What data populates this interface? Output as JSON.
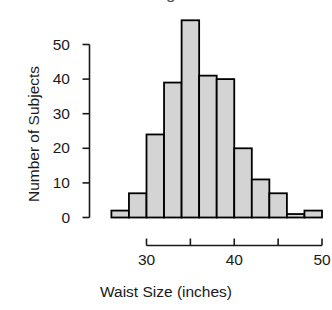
{
  "chart_data": {
    "type": "bar",
    "title": "Histogram",
    "title_truncated": true,
    "xlabel": "Waist Size (inches)",
    "ylabel": "Number of Subjects",
    "categories": [
      "26",
      "28",
      "30",
      "32",
      "34",
      "36",
      "38",
      "40",
      "42",
      "44",
      "46",
      "48"
    ],
    "bin_edges": [
      26,
      28,
      30,
      32,
      34,
      36,
      38,
      40,
      42,
      44,
      46,
      48,
      50
    ],
    "bin_width": 2,
    "values": [
      2,
      7,
      24,
      39,
      57,
      41,
      40,
      20,
      11,
      7,
      1,
      2
    ],
    "xlim": [
      26,
      50
    ],
    "ylim": [
      0,
      57
    ],
    "x_ticks": [
      30,
      35,
      40,
      45,
      50
    ],
    "x_tick_labels": [
      "30",
      "",
      "40",
      "",
      "50"
    ],
    "x_axis_range": [
      30,
      50
    ],
    "y_ticks": [
      0,
      10,
      20,
      30,
      40,
      50
    ],
    "y_tick_labels": [
      "0",
      "10",
      "20",
      "30",
      "40",
      "50"
    ],
    "grid": false,
    "legend": false,
    "bar_fill_color": "#d4d4d4",
    "bar_border_color": "#000000",
    "axis_color": "#1a1a1a",
    "background_color": "#ffffff"
  }
}
